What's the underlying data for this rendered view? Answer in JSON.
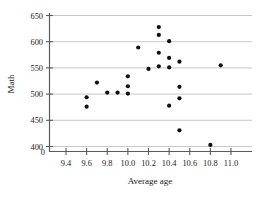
{
  "chart_data": {
    "type": "scatter",
    "title": "",
    "xlabel": "Average age",
    "ylabel": "Math",
    "xlim": [
      9.3,
      11.05
    ],
    "ylim": [
      395,
      655
    ],
    "grid": true,
    "grid_axis": "y",
    "legend": "none",
    "x_ticks": [
      "9.4",
      "9.6",
      "9.8",
      "10.0",
      "10.2",
      "10.4",
      "10.6",
      "10.8",
      "11.0"
    ],
    "x_tick_values": [
      9.4,
      9.6,
      9.8,
      10.0,
      10.2,
      10.4,
      10.6,
      10.8,
      11.0
    ],
    "y_ticks": [
      "400",
      "450",
      "500",
      "550",
      "600",
      "650"
    ],
    "y_tick_values": [
      400,
      450,
      500,
      550,
      600,
      650
    ],
    "y_axis_break_label": "0",
    "marker": "filled-circle",
    "marker_color": "#111111",
    "points": [
      {
        "x": 9.6,
        "y": 493
      },
      {
        "x": 9.6,
        "y": 475
      },
      {
        "x": 9.7,
        "y": 521
      },
      {
        "x": 9.8,
        "y": 502
      },
      {
        "x": 9.9,
        "y": 502
      },
      {
        "x": 10.0,
        "y": 533
      },
      {
        "x": 10.0,
        "y": 514
      },
      {
        "x": 10.0,
        "y": 500
      },
      {
        "x": 10.1,
        "y": 588
      },
      {
        "x": 10.2,
        "y": 547
      },
      {
        "x": 10.3,
        "y": 627
      },
      {
        "x": 10.3,
        "y": 612
      },
      {
        "x": 10.3,
        "y": 578
      },
      {
        "x": 10.3,
        "y": 552
      },
      {
        "x": 10.4,
        "y": 600
      },
      {
        "x": 10.4,
        "y": 568
      },
      {
        "x": 10.4,
        "y": 550
      },
      {
        "x": 10.4,
        "y": 477
      },
      {
        "x": 10.5,
        "y": 561
      },
      {
        "x": 10.5,
        "y": 513
      },
      {
        "x": 10.5,
        "y": 491
      },
      {
        "x": 10.5,
        "y": 430
      },
      {
        "x": 10.8,
        "y": 402
      },
      {
        "x": 10.9,
        "y": 554
      }
    ]
  }
}
